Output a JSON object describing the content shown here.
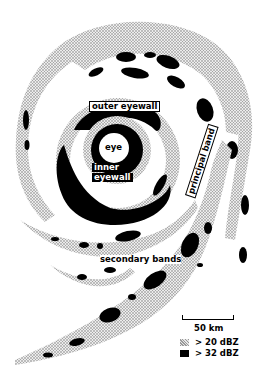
{
  "figure": {
    "labels": {
      "outer_eyewall": "outer eyewall",
      "eye": "eye",
      "inner_eyewall_line1": "inner",
      "inner_eyewall_line2": "eyewall",
      "principal_band": "principal band",
      "secondary_bands": "secondary bands"
    },
    "scale": {
      "label": "50 km"
    },
    "legend": [
      {
        "symbol": "stippled-light",
        "label": "> 20 dBZ",
        "color": "#bdbdbd"
      },
      {
        "symbol": "solid-black",
        "label": "> 32 dBZ",
        "color": "#000000"
      }
    ]
  }
}
